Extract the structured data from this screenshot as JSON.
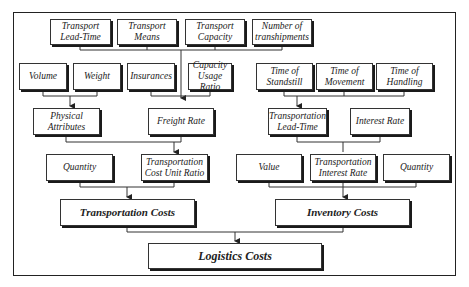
{
  "diagram": {
    "nodes": {
      "transport_lead_time": "Transport\nLead-Time",
      "transport_means": "Transport\nMeans",
      "transport_capacity": "Transport\nCapacity",
      "number_of_transhipments": "Number of\ntranshipments",
      "volume": "Volume",
      "weight": "Weight",
      "insurances": "Insurances",
      "capacity_usage_ratio": "Capacity\nUsage Ratio",
      "time_of_standstill": "Time of\nStandstill",
      "time_of_movement": "Time of\nMovement",
      "time_of_handling": "Time of\nHandling",
      "physical_attributes": "Physical\nAttributes",
      "freight_rate": "Freight Rate",
      "transportation_lead_time": "Transportation\nLead-Time",
      "interest_rate": "Interest Rate",
      "quantity_left": "Quantity",
      "transportation_cost_unit_ratio": "Transportation\nCost Unit Ratio",
      "value": "Value",
      "transportation_interest_rate": "Transportation\nInterest Rate",
      "quantity_right": "Quantity",
      "transportation_costs": "Transportation Costs",
      "inventory_costs": "Inventory Costs",
      "logistics_costs": "Logistics Costs"
    },
    "edges": [
      {
        "from": [
          "transport_lead_time",
          "transport_means",
          "transport_capacity",
          "number_of_transhipments"
        ],
        "to": "freight_rate"
      },
      {
        "from": [
          "volume",
          "weight"
        ],
        "to": "physical_attributes"
      },
      {
        "from": [
          "insurances",
          "capacity_usage_ratio"
        ],
        "to": "freight_rate"
      },
      {
        "from": [
          "time_of_standstill",
          "time_of_movement",
          "time_of_handling"
        ],
        "to": "transportation_lead_time"
      },
      {
        "from": [
          "physical_attributes",
          "freight_rate"
        ],
        "to": "transportation_cost_unit_ratio"
      },
      {
        "from": [
          "transportation_lead_time",
          "interest_rate"
        ],
        "to": "transportation_interest_rate"
      },
      {
        "from": [
          "quantity_left",
          "transportation_cost_unit_ratio"
        ],
        "to": "transportation_costs"
      },
      {
        "from": [
          "value",
          "transportation_interest_rate",
          "quantity_right"
        ],
        "to": "inventory_costs"
      },
      {
        "from": [
          "transportation_costs",
          "inventory_costs"
        ],
        "to": "logistics_costs"
      }
    ]
  }
}
